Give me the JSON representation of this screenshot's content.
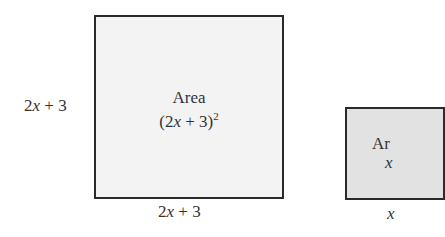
{
  "big_square": {
    "side_label": "2x + 3",
    "area_title": "Area",
    "area_expr": "(2x + 3)",
    "area_exp": "2",
    "bottom_label": "2x + 3"
  },
  "small_square": {
    "area_title": "Ar",
    "area_expr": "x",
    "bottom_label": "x"
  }
}
